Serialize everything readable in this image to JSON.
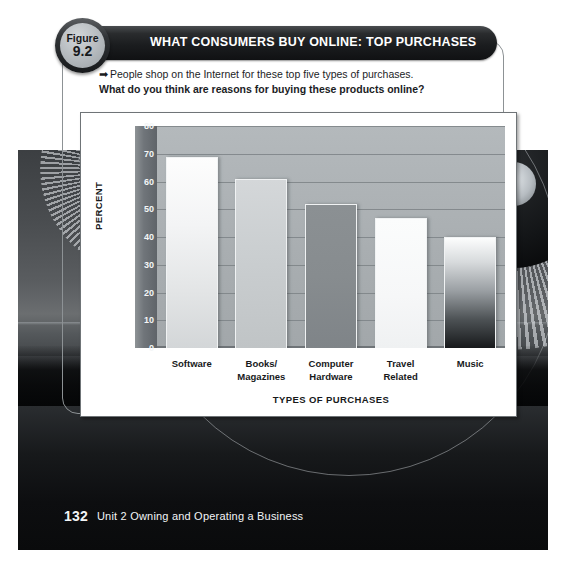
{
  "figure": {
    "badge_label": "Figure",
    "badge_number": "9.2",
    "title": "WHAT CONSUMERS BUY ONLINE: TOP PURCHASES",
    "caption_arrow": "➡",
    "caption_line1": "People shop on the Internet for these top five types of purchases.",
    "caption_line2": "What do you think are reasons for buying these products online?"
  },
  "footer": {
    "page_number": "132",
    "unit_text": "Unit 2  Owning and Operating a Business"
  },
  "colors": {
    "title_bar": "#1b1d1f",
    "badge_fill": "#b4b9bd",
    "plot_background": "#a9aeb1",
    "axis_band": "#70757a",
    "panel_background": "#ffffff",
    "text": "#17191b"
  },
  "chart_data": {
    "type": "bar",
    "title": "WHAT CONSUMERS BUY ONLINE: TOP PURCHASES",
    "xlabel": "TYPES OF PURCHASES",
    "ylabel": "PERCENT",
    "ylim": [
      0,
      80
    ],
    "yticks": [
      0,
      10,
      20,
      30,
      40,
      50,
      60,
      70,
      80
    ],
    "ytick_labels": [
      "0",
      "10",
      "20",
      "30",
      "40",
      "50",
      "60",
      "70",
      "80"
    ],
    "grid": true,
    "legend": "none",
    "categories": [
      "Software",
      "Books/\nMagazines",
      "Computer\nHardware",
      "Travel\nRelated",
      "Music"
    ],
    "category_lines": [
      [
        "Software",
        ""
      ],
      [
        "Books/",
        "Magazines"
      ],
      [
        "Computer",
        "Hardware"
      ],
      [
        "Travel",
        "Related"
      ],
      [
        "Music",
        ""
      ]
    ],
    "values": [
      69,
      61,
      52,
      47,
      40
    ],
    "bar_fills": [
      "light-gradient",
      "medium-gradient",
      "dark-solid",
      "white-solid",
      "white-to-black-gradient"
    ]
  }
}
